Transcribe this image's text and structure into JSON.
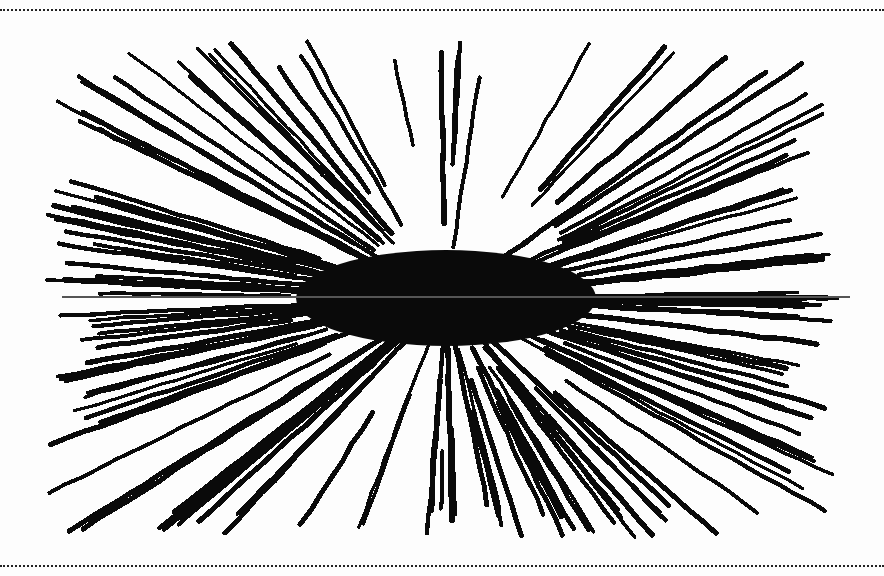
{
  "page": {
    "background": "#fdfdfd",
    "ink": "#0a0a0a",
    "rule_color": "#222222"
  },
  "figure": {
    "center": [
      446,
      298
    ],
    "bounds": {
      "xmin": 30,
      "xmax": 856,
      "ymin": 30,
      "ymax": 548
    },
    "stroke_width": 4.2,
    "horizontal_line": {
      "y": 297,
      "x1": 62,
      "x2": 850,
      "color": "#555555",
      "width": 2
    },
    "rays": {
      "count": 150,
      "inner_radius_min": 40,
      "inner_radius_max": 160,
      "outer_fill": 0.96,
      "seed": 17
    }
  }
}
